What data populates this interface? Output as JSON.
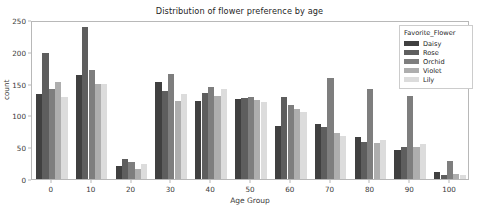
{
  "chart_data": {
    "type": "bar",
    "title": "Distribution of flower preference by age",
    "xlabel": "Age Group",
    "ylabel": "count",
    "categories": [
      "0",
      "10",
      "20",
      "30",
      "40",
      "50",
      "60",
      "70",
      "80",
      "90",
      "100"
    ],
    "ylim": [
      0,
      250
    ],
    "yticks": [
      0,
      50,
      100,
      150,
      200,
      250
    ],
    "grid": false,
    "legend": {
      "title": "Favorite_Flower",
      "position": "upper right"
    },
    "series": [
      {
        "name": "Daisy",
        "color": "#404040",
        "values": [
          134,
          163,
          20,
          152,
          122,
          126,
          83,
          87,
          66,
          46,
          11
        ]
      },
      {
        "name": "Rose",
        "color": "#5e5e5e",
        "values": [
          198,
          239,
          31,
          138,
          135,
          128,
          129,
          82,
          58,
          51,
          6
        ]
      },
      {
        "name": "Orchid",
        "color": "#7e7e7e",
        "values": [
          141,
          171,
          27,
          165,
          144,
          129,
          117,
          159,
          141,
          130,
          28
        ]
      },
      {
        "name": "Violet",
        "color": "#aeaeae",
        "values": [
          152,
          150,
          15,
          122,
          130,
          125,
          110,
          72,
          57,
          50,
          8
        ]
      },
      {
        "name": "Lily",
        "color": "#dcdcdc",
        "values": [
          129,
          149,
          23,
          133,
          141,
          121,
          106,
          67,
          62,
          55,
          6
        ]
      }
    ]
  },
  "figure": {
    "background_color": "#ffffff",
    "axes_color": "#b8b8b8",
    "text_color": "#262626"
  }
}
